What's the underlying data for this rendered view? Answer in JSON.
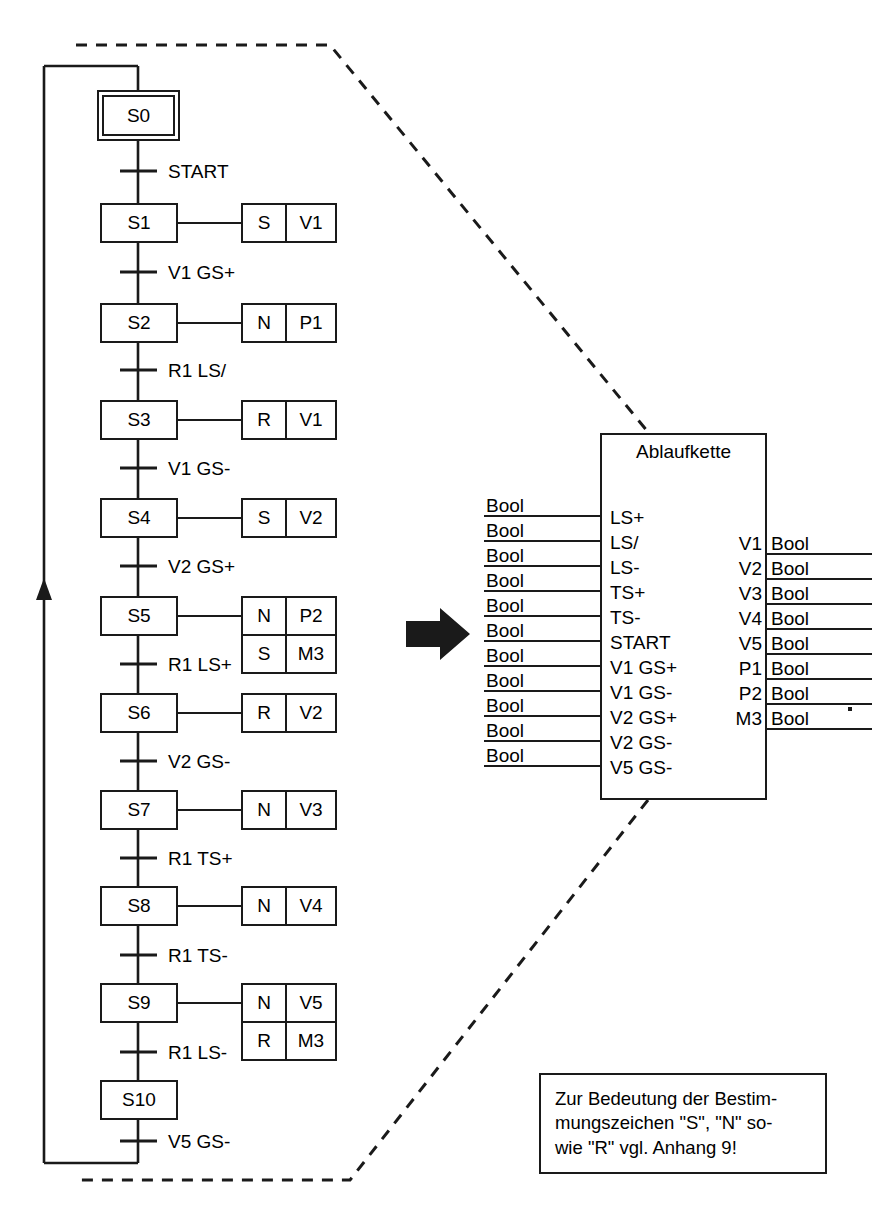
{
  "diagram": {
    "type": "sequential-function-chart"
  },
  "sfc": {
    "initial_step": {
      "name": "S0"
    },
    "steps": [
      {
        "name": "S0",
        "initial": true
      },
      {
        "name": "S1"
      },
      {
        "name": "S2"
      },
      {
        "name": "S3"
      },
      {
        "name": "S4"
      },
      {
        "name": "S5"
      },
      {
        "name": "S6"
      },
      {
        "name": "S7"
      },
      {
        "name": "S8"
      },
      {
        "name": "S9"
      },
      {
        "name": "S10"
      }
    ],
    "transitions": [
      {
        "after": "S0",
        "label": "START"
      },
      {
        "after": "S1",
        "label": "V1 GS+"
      },
      {
        "after": "S2",
        "label": "R1 LS/"
      },
      {
        "after": "S3",
        "label": "V1 GS-"
      },
      {
        "after": "S4",
        "label": "V2 GS+"
      },
      {
        "after": "S5",
        "label": "R1 LS+"
      },
      {
        "after": "S6",
        "label": "V2 GS-"
      },
      {
        "after": "S7",
        "label": "R1 TS+"
      },
      {
        "after": "S8",
        "label": "R1 TS-"
      },
      {
        "after": "S9",
        "label": "R1 LS-"
      },
      {
        "after": "S10",
        "label": "V5 GS-"
      }
    ],
    "actions": [
      {
        "step": "S1",
        "qualifier": "S",
        "target": "V1"
      },
      {
        "step": "S2",
        "qualifier": "N",
        "target": "P1"
      },
      {
        "step": "S3",
        "qualifier": "R",
        "target": "V1"
      },
      {
        "step": "S4",
        "qualifier": "S",
        "target": "V2"
      },
      {
        "step": "S5",
        "qualifier": "N",
        "target": "P2"
      },
      {
        "step": "S5",
        "qualifier": "S",
        "target": "M3"
      },
      {
        "step": "S6",
        "qualifier": "R",
        "target": "V2"
      },
      {
        "step": "S7",
        "qualifier": "N",
        "target": "V3"
      },
      {
        "step": "S8",
        "qualifier": "N",
        "target": "V4"
      },
      {
        "step": "S9",
        "qualifier": "N",
        "target": "V5"
      },
      {
        "step": "S9",
        "qualifier": "R",
        "target": "M3"
      }
    ]
  },
  "function_block": {
    "title": "Ablaufkette",
    "inputs": [
      {
        "type": "Bool",
        "name": "LS+"
      },
      {
        "type": "Bool",
        "name": "LS/"
      },
      {
        "type": "Bool",
        "name": "LS-"
      },
      {
        "type": "Bool",
        "name": "TS+"
      },
      {
        "type": "Bool",
        "name": "TS-"
      },
      {
        "type": "Bool",
        "name": "START"
      },
      {
        "type": "Bool",
        "name": "V1 GS+"
      },
      {
        "type": "Bool",
        "name": "V1 GS-"
      },
      {
        "type": "Bool",
        "name": "V2 GS+"
      },
      {
        "type": "Bool",
        "name": "V2 GS-"
      },
      {
        "type": "Bool",
        "name": "V5 GS-"
      }
    ],
    "outputs": [
      {
        "name": "V1",
        "type": "Bool"
      },
      {
        "name": "V2",
        "type": "Bool"
      },
      {
        "name": "V3",
        "type": "Bool"
      },
      {
        "name": "V4",
        "type": "Bool"
      },
      {
        "name": "V5",
        "type": "Bool"
      },
      {
        "name": "P1",
        "type": "Bool"
      },
      {
        "name": "P2",
        "type": "Bool"
      },
      {
        "name": "M3",
        "type": "Bool"
      }
    ]
  },
  "note": {
    "line1": "Zur Bedeutung der Bestim-",
    "line2": "mungszeichen \"S\", \"N\" so-",
    "line3": "wie \"R\" vgl. Anhang 9!"
  },
  "colors": {
    "ink": "#1a1a1a",
    "paper": "#ffffff"
  }
}
